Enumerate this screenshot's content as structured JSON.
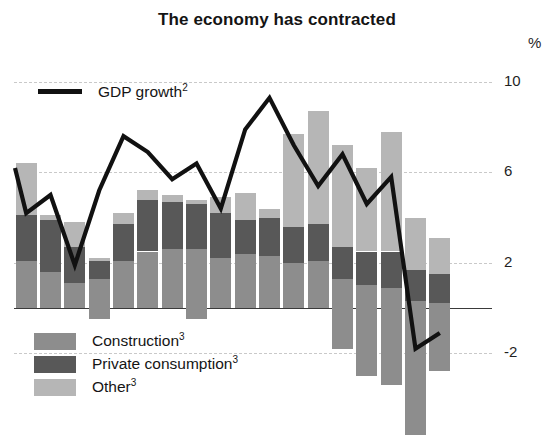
{
  "chart_data": {
    "type": "bar",
    "subtype": "stacked-bar-with-line-overlay",
    "title": "The economy has contracted",
    "xlabel": "",
    "ylabel": "%",
    "unit": "%",
    "ylim": [
      -6,
      10
    ],
    "yticks": [
      10,
      6,
      2,
      -2
    ],
    "ytick_labels": [
      "10",
      "6",
      "2",
      "-2"
    ],
    "zero_line": 0,
    "grid": true,
    "grid_style": "dashed horizontal",
    "legend_position": "inside-top-left and inside-bottom-left",
    "n_categories": 18,
    "categories": [
      "1",
      "2",
      "3",
      "4",
      "5",
      "6",
      "7",
      "8",
      "9",
      "10",
      "11",
      "12",
      "13",
      "14",
      "15",
      "16",
      "17",
      "18"
    ],
    "series": [
      {
        "name": "Construction",
        "footnote": "3",
        "color": "#8d8d8d",
        "stack": "contributions",
        "stack_order": 1,
        "values": [
          2.1,
          1.6,
          1.1,
          1.3,
          2.1,
          2.5,
          2.6,
          2.6,
          2.2,
          2.4,
          2.3,
          2.0,
          2.1,
          1.3,
          1.0,
          0.9,
          0.3,
          0.2
        ]
      },
      {
        "name": "Private consumption",
        "footnote": "3",
        "color": "#585858",
        "stack": "contributions",
        "stack_order": 2,
        "values": [
          2.0,
          2.3,
          1.6,
          0.8,
          1.6,
          2.3,
          2.1,
          2.0,
          2.0,
          1.5,
          1.7,
          1.6,
          1.6,
          1.4,
          1.5,
          1.6,
          1.4,
          1.3
        ]
      },
      {
        "name": "Other",
        "footnote": "3",
        "color": "#b6b6b6",
        "stack": "contributions",
        "stack_order": 3,
        "values": [
          2.3,
          0.2,
          1.1,
          0.1,
          0.5,
          0.4,
          0.3,
          0.2,
          0.7,
          1.2,
          0.4,
          4.1,
          5.0,
          4.5,
          3.7,
          5.3,
          2.3,
          1.6
        ]
      },
      {
        "name": "Negative contribution",
        "footnote": "3",
        "color": "#8d8d8d",
        "stack": "contributions-negative",
        "stack_order": 0,
        "values": [
          0,
          0,
          0,
          -0.5,
          0,
          0,
          0,
          -0.5,
          0,
          0,
          0,
          0,
          0,
          -1.8,
          -3.0,
          -3.4,
          -5.6,
          -2.8
        ]
      }
    ],
    "line_series": {
      "name": "GDP growth",
      "footnote": "2",
      "color": "#111111",
      "values": [
        6.2,
        4.2,
        5.0,
        1.9,
        5.2,
        7.6,
        6.9,
        5.7,
        6.4,
        4.4,
        7.9,
        9.3,
        7.2,
        5.4,
        6.8,
        4.6,
        5.8,
        -1.8,
        -1.1
      ],
      "values_note": "read from peaks of the overlaid black polyline"
    },
    "notes": {
      "construction_footnote": "3",
      "private_consumption_footnote": "3",
      "other_footnote": "3",
      "gdp_growth_footnote": "2"
    }
  },
  "header": {
    "title": "The economy has contracted"
  },
  "axis": {
    "unit_label": "%",
    "ticks": [
      {
        "label": "10",
        "value": 10
      },
      {
        "label": "6",
        "value": 6
      },
      {
        "label": "2",
        "value": 2
      },
      {
        "label": "-2",
        "value": -2
      }
    ]
  },
  "legend_line": {
    "label": "GDP growth",
    "footnote": "2",
    "color": "#111111"
  },
  "legend_stack": {
    "items": [
      {
        "label": "Construction",
        "footnote": "3",
        "color": "#8d8d8d"
      },
      {
        "label": "Private consumption",
        "footnote": "3",
        "color": "#585858"
      },
      {
        "label": "Other",
        "footnote": "3",
        "color": "#b6b6b6"
      }
    ]
  }
}
